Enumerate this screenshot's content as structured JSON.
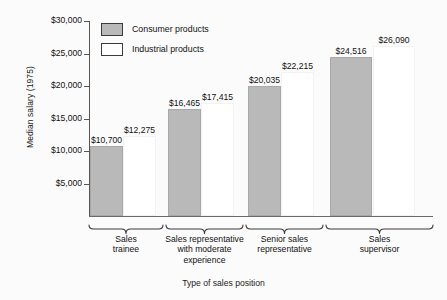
{
  "chart_data": {
    "type": "bar",
    "title": "",
    "xlabel": "Type of sales position",
    "ylabel": "Median salary (1975)",
    "ylim": [
      0,
      30000
    ],
    "ytick_values": [
      5000,
      10000,
      15000,
      20000,
      25000,
      30000
    ],
    "ytick_labels": [
      "$5,000",
      "$10,000",
      "$15,000",
      "$20,000",
      "$25,000",
      "$30,000"
    ],
    "grid": false,
    "legend_position": "top-left",
    "categories": [
      "Sales trainee",
      "Sales representative with moderate experience",
      "Senior sales representative",
      "Sales supervisor"
    ],
    "category_label_lines": [
      [
        "Sales",
        "trainee"
      ],
      [
        "Sales representative",
        "with moderate",
        "experience"
      ],
      [
        "Senior sales",
        "representative"
      ],
      [
        "Sales",
        "supervisor"
      ]
    ],
    "series": [
      {
        "name": "Consumer products",
        "color": "#b9b9b9",
        "values": [
          10700,
          16465,
          20035,
          24516
        ],
        "value_labels": [
          "$10,700",
          "$16,465",
          "$20,035",
          "$24,516"
        ]
      },
      {
        "name": "Industrial products",
        "color": "#ffffff",
        "values": [
          12275,
          17415,
          22215,
          26090
        ],
        "value_labels": [
          "$12,275",
          "$17,415",
          "$22,215",
          "$26,090"
        ]
      }
    ]
  },
  "legend": {
    "items": [
      {
        "label": "Consumer products",
        "swatch": "consumer"
      },
      {
        "label": "Industrial products",
        "swatch": "industrial"
      }
    ]
  }
}
